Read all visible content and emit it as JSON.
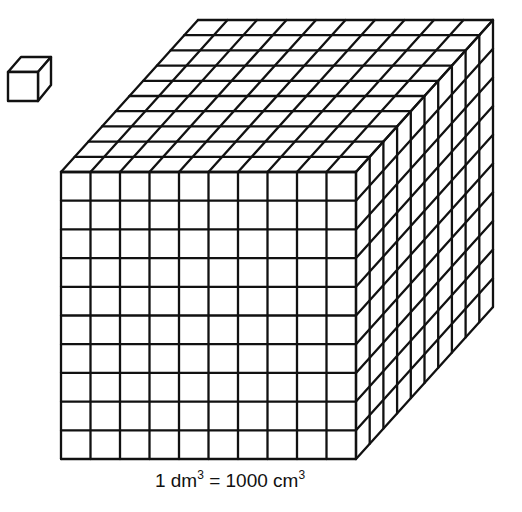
{
  "diagram": {
    "small_cube": {
      "label": "1 cm cube",
      "icon": "unit-cube-icon"
    },
    "large_cube": {
      "label": "1 dm cube",
      "divisions": 10,
      "front_face": {
        "x0": 61,
        "y0": 172,
        "x1": 356,
        "y1": 459
      },
      "depth_offset": {
        "dx": 137,
        "dy": -152
      }
    },
    "stroke_color": "#111111",
    "background_color": "#ffffff"
  },
  "caption": {
    "lhs_number": "1",
    "lhs_unit": "dm",
    "lhs_exp": "3",
    "equals": "=",
    "rhs_number": "1000",
    "rhs_unit": "cm",
    "rhs_exp": "3"
  }
}
